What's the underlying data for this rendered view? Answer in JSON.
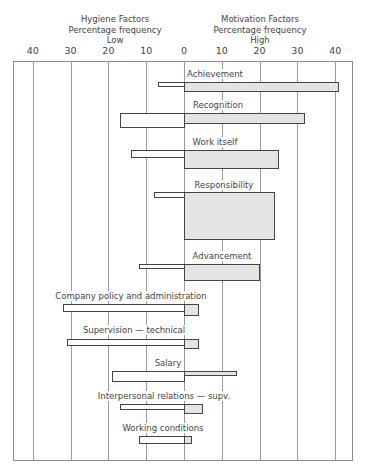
{
  "header": {
    "left": [
      "Hygiene Factors",
      "Percentage frequency",
      "Low"
    ],
    "right": [
      "Motivation Factors",
      "Percentage frequency",
      "High"
    ]
  },
  "chart_data": {
    "type": "bar",
    "orientation": "horizontal-diverging",
    "title": "",
    "xlabel_left": "Hygiene Factors — Percentage frequency — Low",
    "xlabel_right": "Motivation Factors — Percentage frequency — High",
    "tick_labels": [
      "40",
      "30",
      "20",
      "10",
      "0",
      "10",
      "20",
      "30",
      "40"
    ],
    "xlim": [
      -45,
      45
    ],
    "categories": [
      "Achievement",
      "Recognition",
      "Work itself",
      "Responsibility",
      "Advancement",
      "Company policy and administration",
      "Supervision — technical",
      "Salary",
      "Interpersonal relations — supv.",
      "Working conditions"
    ],
    "series": [
      {
        "name": "Low (hygiene / dissatisfaction)",
        "values": [
          7,
          17,
          14,
          8,
          12,
          32,
          31,
          19,
          17,
          12
        ]
      },
      {
        "name": "High (motivation / satisfaction)",
        "values": [
          41,
          32,
          25,
          24,
          20,
          4,
          4,
          14,
          5,
          2
        ]
      }
    ],
    "grid": true,
    "colors": {
      "low": "#ffffff",
      "high": "#e4e4e4",
      "outline": "#444444"
    }
  },
  "rows": [
    {
      "label": "Achievement",
      "low": 7,
      "high": 41,
      "label_y": 69,
      "ly": 82,
      "lh": 5,
      "hy": 82,
      "hh": 10,
      "lx": 215
    },
    {
      "label": "Recognition",
      "low": 17,
      "high": 32,
      "label_y": 100,
      "ly": 113,
      "lh": 15,
      "hy": 113,
      "hh": 11,
      "lx": 218
    },
    {
      "label": "Work itself",
      "low": 14,
      "high": 25,
      "label_y": 137,
      "ly": 150,
      "lh": 8,
      "hy": 150,
      "hh": 19,
      "lx": 215
    },
    {
      "label": "Responsibility",
      "low": 8,
      "high": 24,
      "label_y": 180,
      "ly": 192,
      "lh": 6,
      "hy": 192,
      "hh": 48,
      "lx": 224
    },
    {
      "label": "Advancement",
      "low": 12,
      "high": 20,
      "label_y": 251,
      "ly": 264,
      "lh": 5,
      "hy": 264,
      "hh": 17,
      "lx": 222
    },
    {
      "label": "Company policy and administration",
      "low": 32,
      "high": 4,
      "label_y": 291,
      "ly": 304,
      "lh": 8,
      "hy": 304,
      "hh": 12,
      "lx": 131
    },
    {
      "label": "Supervision — technical",
      "low": 31,
      "high": 4,
      "label_y": 325,
      "ly": 339,
      "lh": 7,
      "hy": 339,
      "hh": 10,
      "lx": 134
    },
    {
      "label": "Salary",
      "low": 19,
      "high": 14,
      "label_y": 358,
      "ly": 371,
      "lh": 11,
      "hy": 371,
      "hh": 5,
      "lx": 168
    },
    {
      "label": "Interpersonal relations — supv.",
      "low": 17,
      "high": 5,
      "label_y": 391,
      "ly": 404,
      "lh": 6,
      "hy": 404,
      "hh": 10,
      "lx": 164
    },
    {
      "label": "Working conditions",
      "low": 12,
      "high": 2,
      "label_y": 423,
      "ly": 436,
      "lh": 8,
      "hy": 436,
      "hh": 8,
      "lx": 163
    }
  ]
}
